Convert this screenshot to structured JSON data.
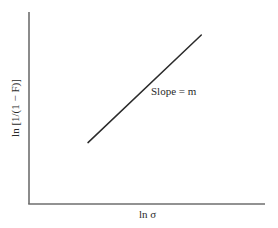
{
  "chart_data": {
    "type": "line",
    "title": "",
    "xlabel": "ln σ",
    "ylabel": "ln [1/(1 − F)]",
    "annotations": [
      {
        "text": "Slope = m",
        "position": "right of line, mid-height"
      }
    ],
    "grid": false,
    "legend": null,
    "ticks": {
      "x": [],
      "y": []
    },
    "series": [
      {
        "name": "Weibull plot",
        "x": [
          0.25,
          0.73
        ],
        "y": [
          0.32,
          0.88
        ],
        "style": "solid straight line, positive slope"
      }
    ],
    "xlim": [
      0,
      1
    ],
    "ylim": [
      0,
      1
    ],
    "colors": {
      "axes": "#6e6e6e",
      "line": "#2b2b2b",
      "text": "#2a2a2a",
      "background": "#ffffff"
    }
  },
  "labels": {
    "x_axis": "ln σ",
    "y_axis": "ln [1/(1 − F)]",
    "slope_annotation": "Slope = m"
  }
}
